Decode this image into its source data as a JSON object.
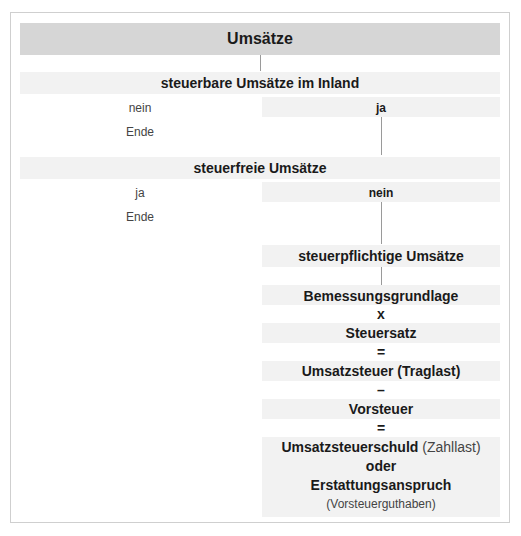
{
  "diagram": {
    "title": "Umsätze",
    "step1": {
      "label": "steuerbare Umsätze im Inland",
      "no_label": "nein",
      "no_result": "Ende",
      "yes_label": "ja"
    },
    "step2": {
      "label": "steuerfreie Umsätze",
      "yes_label": "ja",
      "yes_result": "Ende",
      "no_label": "nein"
    },
    "step3": {
      "label": "steuerpflichtige Umsätze"
    },
    "calculation": {
      "line1": "Bemessungsgrundlage",
      "op1": "x",
      "line2": "Steuersatz",
      "op2": "=",
      "line3": "Umsatzsteuer (Traglast)",
      "op3": "–",
      "line4": "Vorsteuer",
      "op4": "=",
      "line5_bold": "Umsatzsteuerschuld",
      "line5_normal": " (Zahllast)",
      "line6": "oder",
      "line7": "Erstattungsanspruch",
      "line8": "(Vorsteuerguthaben)"
    }
  },
  "colors": {
    "header_band": "#d6d6d6",
    "light_band": "#f2f2f2",
    "connector": "#9a9a9a",
    "border": "#cfcfcf"
  }
}
